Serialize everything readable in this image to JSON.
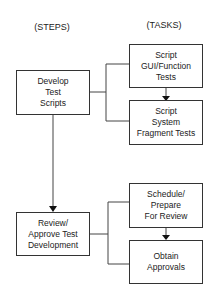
{
  "headers": {
    "steps": "(STEPS)",
    "tasks": "(TASKS)"
  },
  "steps": [
    {
      "label": "Develop\nTest\nScripts"
    },
    {
      "label": "Review/\nApprove Test\nDevelopment"
    }
  ],
  "tasks": [
    {
      "label": "Script\nGUI/Function\nTests"
    },
    {
      "label": "Script\nSystem\nFragment Tests"
    },
    {
      "label": "Schedule/\nPrepare\nFor Review"
    },
    {
      "label": "Obtain\nApprovals"
    }
  ],
  "colors": {
    "line": "#333333",
    "background": "#ffffff"
  }
}
